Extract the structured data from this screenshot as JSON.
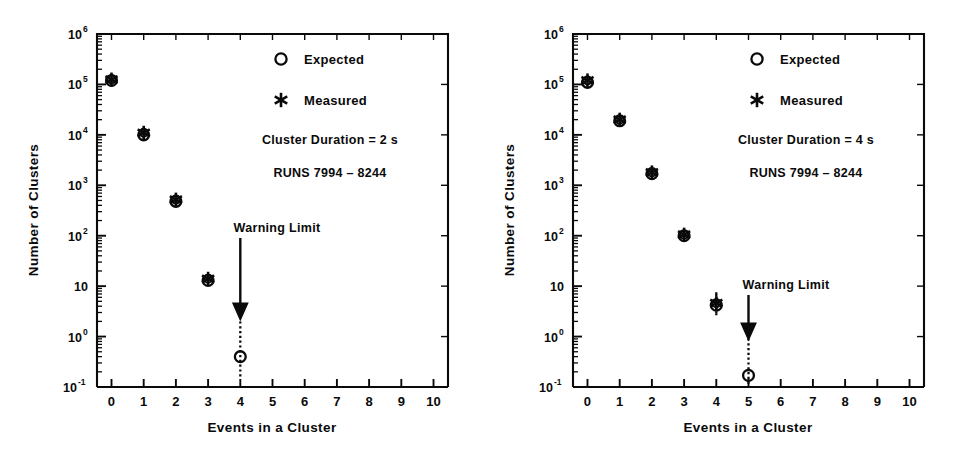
{
  "figure": {
    "background_color": "#ffffff",
    "ink_color": "#0a0a0a",
    "panel_count": 2
  },
  "chart_data": [
    {
      "type": "scatter",
      "panel": "left",
      "title": "",
      "xlabel": "Events in a Cluster",
      "ylabel": "Number of Clusters",
      "xlim": [
        -0.45,
        10.45
      ],
      "ylim": [
        -1,
        6
      ],
      "yscale": "log",
      "xticks": [
        0,
        1,
        2,
        3,
        4,
        5,
        6,
        7,
        8,
        9,
        10
      ],
      "xticklabels": [
        "0",
        "1",
        "2",
        "3",
        "4",
        "5",
        "6",
        "7",
        "8",
        "9",
        "10"
      ],
      "yticks_exponents": [
        6,
        5,
        4,
        3,
        2,
        1,
        0,
        -1
      ],
      "yticklabels": [
        "10⁶",
        "10⁵",
        "10⁴",
        "10³",
        "10²",
        "10",
        "10⁰",
        "10⁻¹"
      ],
      "ytick_mantissas": [
        "10",
        "10",
        "10",
        "10",
        "10",
        "10",
        "10",
        "10"
      ],
      "ytick_exponents": [
        "6",
        "5",
        "4",
        "3",
        "2",
        "",
        "0",
        "-1"
      ],
      "grid": false,
      "minor_ticks": true,
      "legend_position": "upper-right-inside",
      "series": [
        {
          "name": "Expected",
          "marker": "open-circle",
          "x": [
            0,
            1,
            2,
            3,
            4
          ],
          "values": [
            120000,
            10000,
            480,
            13,
            0.4
          ],
          "yerr_low": [
            null,
            null,
            null,
            null,
            0.25
          ],
          "yerr_high": [
            null,
            null,
            null,
            null,
            1.6
          ]
        },
        {
          "name": "Measured",
          "marker": "asterisk",
          "x": [
            0,
            1,
            2,
            3
          ],
          "values": [
            125000,
            11000,
            520,
            14
          ],
          "yerr_low": [
            null,
            null,
            null,
            null
          ],
          "yerr_high": [
            null,
            null,
            null,
            null
          ]
        }
      ],
      "annotations": [
        {
          "text": "Cluster Duration = 2 s",
          "x_px": 330,
          "y_px": 140
        },
        {
          "text": "RUNS 7994 – 8244",
          "x_px": 330,
          "y_px": 173
        },
        {
          "text": "Warning Limit",
          "x_px": 273,
          "y_px": 228
        }
      ],
      "arrow": {
        "from_x": 4,
        "from_y_px": 238,
        "to_y_px": 320,
        "points_to": "Expected point at x = 4"
      }
    },
    {
      "type": "scatter",
      "panel": "right",
      "title": "",
      "xlabel": "Events in a Cluster",
      "ylabel": "Number of Clusters",
      "xlim": [
        -0.45,
        10.45
      ],
      "ylim": [
        -1,
        6
      ],
      "yscale": "log",
      "xticks": [
        0,
        1,
        2,
        3,
        4,
        5,
        6,
        7,
        8,
        9,
        10
      ],
      "xticklabels": [
        "0",
        "1",
        "2",
        "3",
        "4",
        "5",
        "6",
        "7",
        "8",
        "9",
        "10"
      ],
      "yticks_exponents": [
        6,
        5,
        4,
        3,
        2,
        1,
        0,
        -1
      ],
      "yticklabels": [
        "10⁶",
        "10⁵",
        "10⁴",
        "10³",
        "10²",
        "10",
        "10⁰",
        "10⁻¹"
      ],
      "ytick_mantissas": [
        "10",
        "10",
        "10",
        "10",
        "10",
        "10",
        "10",
        "10"
      ],
      "ytick_exponents": [
        "6",
        "5",
        "4",
        "3",
        "2",
        "",
        "0",
        "-1"
      ],
      "grid": false,
      "minor_ticks": true,
      "legend_position": "upper-right-inside",
      "series": [
        {
          "name": "Expected",
          "marker": "open-circle",
          "x": [
            0,
            1,
            2,
            3,
            4,
            5
          ],
          "values": [
            110000,
            19000,
            1700,
            100,
            4.2,
            0.17
          ],
          "yerr_low": [
            null,
            null,
            null,
            null,
            1.6,
            0.11
          ],
          "yerr_high": [
            null,
            null,
            null,
            null,
            2.8,
            0.75
          ]
        },
        {
          "name": "Measured",
          "marker": "asterisk",
          "x": [
            0,
            1,
            2,
            3,
            4
          ],
          "values": [
            120000,
            20000,
            1800,
            105,
            4.6
          ],
          "yerr_low": [
            null,
            null,
            null,
            null,
            1.7
          ],
          "yerr_high": [
            null,
            null,
            null,
            null,
            3.0
          ]
        }
      ],
      "annotations": [
        {
          "text": "Cluster Duration = 4 s",
          "x_px": 330,
          "y_px": 140
        },
        {
          "text": "RUNS 7994 – 8244",
          "x_px": 330,
          "y_px": 173
        },
        {
          "text": "Warning Limit",
          "x_px": 305,
          "y_px": 285
        }
      ],
      "arrow": {
        "from_x": 5,
        "from_y_px": 295,
        "to_y_px": 340,
        "points_to": "Expected point at x = 5"
      }
    }
  ],
  "panels": {
    "left": {
      "legend": {
        "expected_label": "Expected",
        "measured_label": "Measured"
      },
      "note_duration": "Cluster Duration = 2 s",
      "note_runs": "RUNS 7994 – 8244",
      "warning_label": "Warning Limit",
      "axis": {
        "xlabel": "Events in a Cluster",
        "ylabel": "Number of Clusters",
        "xticklabels": [
          "0",
          "1",
          "2",
          "3",
          "4",
          "5",
          "6",
          "7",
          "8",
          "9",
          "10"
        ]
      }
    },
    "right": {
      "legend": {
        "expected_label": "Expected",
        "measured_label": "Measured"
      },
      "note_duration": "Cluster Duration = 4 s",
      "note_runs": "RUNS 7994 – 8244",
      "warning_label": "Warning Limit",
      "axis": {
        "xlabel": "Events in a Cluster",
        "ylabel": "Number of Clusters",
        "xticklabels": [
          "0",
          "1",
          "2",
          "3",
          "4",
          "5",
          "6",
          "7",
          "8",
          "9",
          "10"
        ]
      }
    }
  }
}
